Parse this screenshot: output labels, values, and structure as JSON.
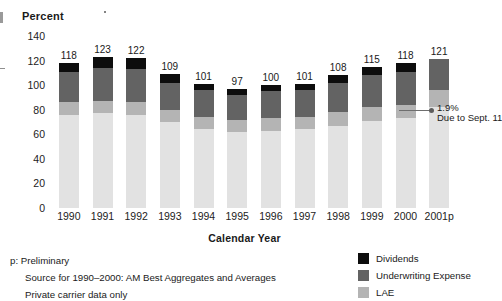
{
  "axes": {
    "y_title": "Percent",
    "x_title": "Calendar Year",
    "y_ticks": [
      "140",
      "120",
      "100",
      "80",
      "60",
      "40",
      "20",
      "0"
    ],
    "x_labels": [
      "1990",
      "1991",
      "1992",
      "1993",
      "1994",
      "1995",
      "1996",
      "1997",
      "1998",
      "1999",
      "2000",
      "2001p"
    ]
  },
  "annotation": {
    "value": "1.9%",
    "caption": "Due to Sept. 11"
  },
  "footnotes": [
    "p: Preliminary",
    "Source for 1990–2000: AM Best Aggregates and Averages",
    "Private carrier data only"
  ],
  "legend": {
    "items": [
      {
        "label": "Dividends",
        "color": "#0d0d0d"
      },
      {
        "label": "Underwriting Expense",
        "color": "#636363"
      },
      {
        "label": "LAE",
        "color": "#b4b4b4"
      }
    ]
  },
  "chart_data": {
    "type": "bar",
    "title": "Percent",
    "xlabel": "Calendar Year",
    "ylabel": "Percent",
    "ylim": [
      0,
      140
    ],
    "grid": false,
    "stacked": true,
    "legend_position": "bottom-right",
    "categories": [
      "1990",
      "1991",
      "1992",
      "1993",
      "1994",
      "1995",
      "1996",
      "1997",
      "1998",
      "1999",
      "2000",
      "2001p"
    ],
    "totals": [
      118,
      123,
      122,
      109,
      101,
      97,
      100,
      101,
      108,
      115,
      118,
      121
    ],
    "series": [
      {
        "name": "Losses",
        "color": "#e2e2e2",
        "values": [
          76,
          77,
          76,
          70,
          64,
          62,
          63,
          64,
          67,
          71,
          73,
          82
        ]
      },
      {
        "name": "LAE",
        "color": "#b4b4b4",
        "values": [
          10,
          10,
          10,
          10,
          10,
          10,
          10,
          10,
          11,
          11,
          11,
          14
        ]
      },
      {
        "name": "Underwriting Expense",
        "color": "#636363",
        "values": [
          25,
          27,
          27,
          22,
          22,
          20,
          22,
          22,
          24,
          26,
          27,
          25
        ]
      },
      {
        "name": "Dividends",
        "color": "#0d0d0d",
        "values": [
          7,
          9,
          9,
          7,
          5,
          5,
          5,
          5,
          6,
          7,
          7,
          0
        ]
      }
    ],
    "annotations": [
      {
        "text": "1.9% Due to Sept. 11",
        "target_category": "2001p"
      }
    ]
  }
}
